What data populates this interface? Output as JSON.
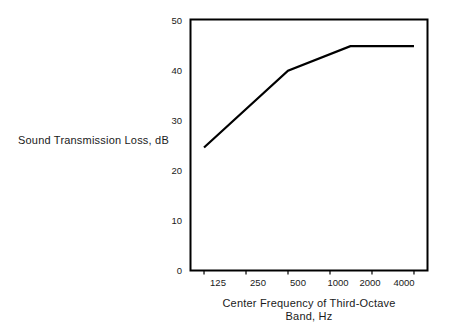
{
  "chart_data": {
    "type": "line",
    "title": "",
    "xlabel": "Center Frequency of Third-Octave Band, Hz",
    "xlabel_line1": "Center Frequency of Third-Octave",
    "xlabel_line2": "Band, Hz",
    "ylabel": "Sound Transmission Loss, dB",
    "x": [
      125,
      500,
      1400,
      4000
    ],
    "values": [
      24.5,
      39.8,
      44.7,
      44.7
    ],
    "series": [
      {
        "name": "Sound Transmission Loss",
        "x": [
          125,
          500,
          1400,
          4000
        ],
        "values": [
          24.5,
          39.8,
          44.7,
          44.7
        ]
      }
    ],
    "xticks": [
      125,
      250,
      500,
      1000,
      2000,
      4000
    ],
    "xtick_labels": [
      "125",
      "250",
      "500",
      "1000",
      "2000",
      "4000"
    ],
    "yticks": [
      0,
      10,
      20,
      30,
      40,
      50
    ],
    "ytick_labels": [
      "0",
      "10",
      "20",
      "30",
      "40",
      "50"
    ],
    "xlim": [
      100,
      5000
    ],
    "ylim": [
      0,
      50
    ],
    "xscale": "log",
    "grid": false,
    "legend": false,
    "line_color": "#000000",
    "frame_color": "#000000",
    "background": "#ffffff"
  },
  "axis": {
    "y_title": "Sound Transmission Loss, dB",
    "x_title_line1": "Center Frequency of Third-Octave",
    "x_title_line2": "Band, Hz",
    "ytick_0": "0",
    "ytick_1": "10",
    "ytick_2": "20",
    "ytick_3": "30",
    "ytick_4": "40",
    "ytick_5": "50",
    "xtick_0": "125",
    "xtick_1": "250",
    "xtick_2": "500",
    "xtick_3": "1000",
    "xtick_4": "2000",
    "xtick_5": "4000"
  }
}
